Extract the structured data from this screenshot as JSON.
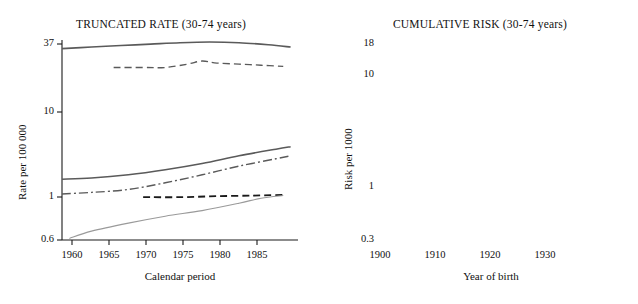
{
  "figure": {
    "background": "#ffffff",
    "line_color_solid_dark": "#5a5a5a",
    "line_color_dashed": "#5a5a5a",
    "line_color_dashdot": "#5a5a5a",
    "line_color_light": "#9a9a9a"
  },
  "panels": [
    {
      "id": "truncated-rate",
      "title": "TRUNCATED RATE (30-74 years)",
      "ylabel": "Rate per 100 000",
      "xlabel": "Calendar period",
      "yticks": [
        "0.6",
        "1",
        "10",
        "37"
      ],
      "xticks": [
        "1960",
        "1965",
        "1970",
        "1975",
        "1980",
        "1985"
      ]
    },
    {
      "id": "cumulative-risk",
      "title": "CUMULATIVE RISK (30-74 years)",
      "ylabel": "Risk per 1000",
      "xlabel": "Year of birth",
      "yticks": [
        "0.3",
        "1",
        "10",
        "18"
      ],
      "xticks": [
        "1900",
        "1910",
        "1920",
        "1930"
      ]
    }
  ],
  "chart_data": [
    {
      "type": "line",
      "title": "TRUNCATED RATE (30-74 years)",
      "xlabel": "Calendar period",
      "ylabel": "Rate per 100 000",
      "xlim": [
        1956,
        1988
      ],
      "ylim": [
        0.6,
        37
      ],
      "yscale": "log",
      "xticks": [
        1960,
        1965,
        1970,
        1975,
        1980,
        1985
      ],
      "ytick_values": [
        0.6,
        1,
        10,
        37
      ],
      "grid": false,
      "legend": "none",
      "series": [
        {
          "name": "top-solid",
          "style": "solid",
          "color": "#5a5a5a",
          "x": [
            1956,
            1960,
            1964,
            1968,
            1972,
            1976,
            1980,
            1984,
            1987
          ],
          "y": [
            31.0,
            32.0,
            33.0,
            34.0,
            35.0,
            35.5,
            35.0,
            33.5,
            32.0
          ]
        },
        {
          "name": "upper-dashed",
          "style": "dashed",
          "color": "#5a5a5a",
          "x": [
            1963,
            1967,
            1970,
            1973,
            1975,
            1977,
            1980,
            1983,
            1986
          ],
          "y": [
            21.0,
            21.0,
            21.0,
            22.5,
            24.0,
            23.0,
            22.5,
            22.0,
            21.5
          ]
        },
        {
          "name": "middle-solid",
          "style": "solid",
          "color": "#5a5a5a",
          "x": [
            1956,
            1960,
            1965,
            1970,
            1975,
            1980,
            1985,
            1987
          ],
          "y": [
            2.1,
            2.15,
            2.3,
            2.55,
            2.9,
            3.4,
            3.9,
            4.1
          ]
        },
        {
          "name": "middle-dashdot",
          "style": "dashdot",
          "color": "#5a5a5a",
          "x": [
            1956,
            1960,
            1965,
            1970,
            1975,
            1980,
            1985,
            1987
          ],
          "y": [
            1.55,
            1.6,
            1.7,
            1.95,
            2.3,
            2.75,
            3.2,
            3.4
          ]
        },
        {
          "name": "short-dashed-flat",
          "style": "dashed-thick",
          "color": "#1a1a1a",
          "x": [
            1967,
            1972,
            1977,
            1982,
            1986
          ],
          "y": [
            1.45,
            1.45,
            1.48,
            1.5,
            1.52
          ]
        },
        {
          "name": "bottom-light",
          "style": "solid-light",
          "color": "#9a9a9a",
          "x": [
            1957,
            1960,
            1965,
            1970,
            1975,
            1980,
            1983,
            1986
          ],
          "y": [
            0.62,
            0.72,
            0.85,
            0.98,
            1.1,
            1.28,
            1.42,
            1.5
          ]
        }
      ]
    },
    {
      "type": "line",
      "title": "CUMULATIVE RISK (30-74 years)",
      "xlabel": "Year of birth",
      "ylabel": "Risk per 1000",
      "xlim": [
        1898,
        1936
      ],
      "ylim": [
        0.3,
        18
      ],
      "yscale": "log",
      "xticks": [
        1900,
        1910,
        1920,
        1930
      ],
      "ytick_values": [
        0.3,
        1,
        10,
        18
      ],
      "grid": false,
      "legend": "none",
      "series": [
        {
          "name": "top-solid",
          "style": "solid",
          "color": "#5a5a5a",
          "x": [
            1898,
            1902,
            1906,
            1910,
            1914,
            1918,
            1922,
            1926,
            1930,
            1935
          ],
          "y": [
            12.5,
            13.0,
            13.2,
            13.2,
            13.0,
            13.0,
            13.5,
            14.5,
            15.5,
            16.2
          ]
        },
        {
          "name": "upper-dashed",
          "style": "dashed",
          "color": "#5a5a5a",
          "x": [
            1909,
            1913,
            1916,
            1919,
            1922,
            1925,
            1928,
            1931,
            1934
          ],
          "y": [
            10.0,
            10.0,
            9.8,
            9.3,
            9.5,
            10.5,
            11.8,
            13.0,
            14.5
          ]
        },
        {
          "name": "middle-solid",
          "style": "solid",
          "color": "#5a5a5a",
          "x": [
            1898,
            1903,
            1908,
            1913,
            1918,
            1923,
            1928,
            1933,
            1935
          ],
          "y": [
            1.55,
            1.7,
            2.0,
            2.35,
            2.75,
            3.1,
            3.5,
            3.9,
            4.0
          ]
        },
        {
          "name": "middle-dashdot",
          "style": "dashdot",
          "color": "#5a5a5a",
          "x": [
            1898,
            1903,
            1908,
            1913,
            1918,
            1923,
            1928,
            1933,
            1935
          ],
          "y": [
            1.2,
            1.35,
            1.6,
            1.95,
            2.35,
            2.8,
            3.3,
            3.8,
            3.95
          ]
        },
        {
          "name": "short-dashed-flat",
          "style": "dashed-thick",
          "color": "#1a1a1a",
          "x": [
            1909,
            1915,
            1920,
            1925,
            1930
          ],
          "y": [
            0.58,
            0.58,
            0.58,
            0.58,
            0.58
          ]
        },
        {
          "name": "bottom-light",
          "style": "solid-light",
          "color": "#9a9a9a",
          "x": [
            1899,
            1903,
            1908,
            1913,
            1918,
            1923,
            1928,
            1933,
            1935
          ],
          "y": [
            0.33,
            0.42,
            0.55,
            0.72,
            0.95,
            1.2,
            1.45,
            1.6,
            1.65
          ]
        }
      ]
    }
  ]
}
